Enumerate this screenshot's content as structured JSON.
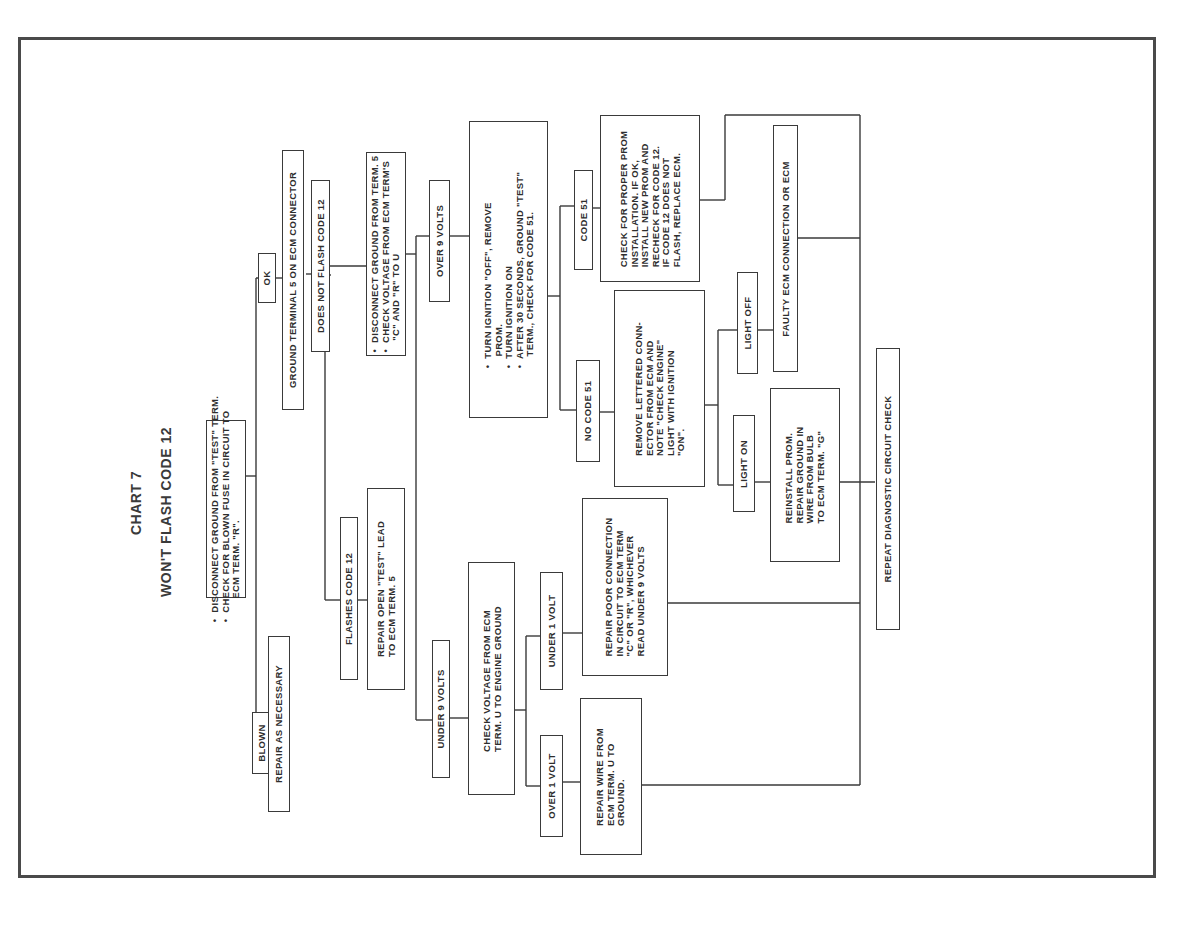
{
  "chart": {
    "number": "CHART 7",
    "title": "WON'T FLASH CODE 12"
  },
  "nodes": {
    "start": "•  DISCONNECT GROUND FROM \"TEST\" TERM.\n•  CHECK FOR BLOWN FUSE IN CIRCUIT TO\n        ECM TERM. \"R\".",
    "blown": "BLOWN",
    "repair_as_necessary": "REPAIR AS NECESSARY",
    "ok": "OK",
    "ground_term5": "GROUND TERMINAL 5 ON ECM CONNECTOR",
    "flashes_code12": "FLASHES CODE 12",
    "repair_open_test": "REPAIR OPEN \"TEST\" LEAD\nTO ECM TERM. 5",
    "does_not_flash": "DOES NOT FLASH CODE 12",
    "disconnect_check_voltage": "•  DISCONNECT GROUND FROM TERM. 5\n•  CHECK VOLTAGE FROM ECM TERM'S\n    \"C\" AND \"R\" TO U",
    "over_9_volts": "OVER 9 VOLTS",
    "under_9_volts": "UNDER 9 VOLTS",
    "turn_ignition": "•  TURN IGNITION \"OFF\", REMOVE\n    PROM.\n•  TURN IGNITION ON\n•  AFTER 30 SECONDS, GROUND \"TEST\"\n    TERM., CHECK FOR CODE 51.",
    "check_voltage_ecm": "CHECK VOLTAGE FROM ECM\nTERM. U TO ENGINE GROUND",
    "code_51": "CODE 51",
    "no_code_51": "NO CODE 51",
    "check_proper_prom": "CHECK FOR PROPER PROM\nINSTALLATION. IF OK,\nINSTALL NEW PROM AND\nRECHECK FOR CODE 12.\nIF CODE 12 DOES NOT\nFLASH, REPLACE ECM.",
    "remove_lettered_conn": "REMOVE LETTERED CONN-\nECTOR FROM ECM AND\nNOTE \"CHECK ENGINE\"\nLIGHT WITH IGNITION\n\"ON\".",
    "under_1_volt": "UNDER 1 VOLT",
    "over_1_volt": "OVER 1 VOLT",
    "repair_poor_connection": "REPAIR POOR CONNECTION\nIN CIRCUIT TO ECM TERM\n\"C\" OR \"R\", WHICHEVER\nREAD UNDER 9 VOLTS",
    "repair_wire": "REPAIR WIRE FROM\nECM TERM. U TO\nGROUND.",
    "light_off": "LIGHT OFF",
    "light_on": "LIGHT ON",
    "faulty_ecm": "FAULTY ECM CONNECTION OR ECM",
    "reinstall_prom": "REINSTALL PROM.\nREPAIR GROUND IN\nWIRE FROM BULB\nTO ECM TERM. \"G\"",
    "repeat_check": "REPEAT DIAGNOSTIC CIRCUIT CHECK"
  },
  "colors": {
    "ink": "#3a3a3a",
    "paper": "#ffffff"
  }
}
